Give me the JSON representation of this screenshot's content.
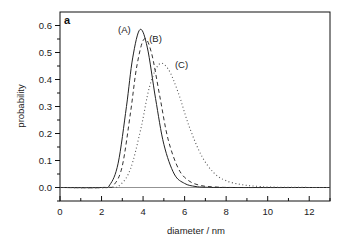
{
  "chart_data": {
    "type": "line",
    "title": "",
    "panel_label": "a",
    "xlabel": "diameter / nm",
    "ylabel": "probability",
    "xlim": [
      0,
      13
    ],
    "ylim": [
      -0.05,
      0.65
    ],
    "x_ticks": [
      0,
      2,
      4,
      6,
      8,
      10,
      12
    ],
    "x_tick_labels": [
      "0",
      "2",
      "4",
      "6",
      "8",
      "10",
      "12"
    ],
    "x_minor_ticks": [
      1,
      3,
      5,
      7,
      9,
      11,
      13
    ],
    "y_ticks": [
      0.0,
      0.1,
      0.2,
      0.3,
      0.4,
      0.5,
      0.6
    ],
    "y_tick_labels": [
      "0.0",
      "0.1",
      "0.2",
      "0.3",
      "0.4",
      "0.5",
      "0.6"
    ],
    "y_minor_ticks": [
      -0.05,
      0.05,
      0.15,
      0.25,
      0.35,
      0.45,
      0.55
    ],
    "grid": false,
    "legend": "inline labels near peaks",
    "series": [
      {
        "name": "(A)",
        "style": "solid",
        "peak_x": 3.85,
        "peak_y": 0.585,
        "x": [
          0,
          2.0,
          2.4,
          2.8,
          3.2,
          3.5,
          3.85,
          4.2,
          4.6,
          5.0,
          5.5,
          6.0,
          6.5,
          7.0,
          8.0,
          13.0
        ],
        "y": [
          0,
          0.0,
          0.01,
          0.09,
          0.3,
          0.48,
          0.585,
          0.52,
          0.33,
          0.16,
          0.05,
          0.015,
          0.004,
          0.001,
          0,
          0
        ]
      },
      {
        "name": "(B)",
        "style": "dashed",
        "peak_x": 4.05,
        "peak_y": 0.55,
        "x": [
          0,
          2.2,
          2.6,
          3.0,
          3.4,
          3.7,
          4.05,
          4.4,
          4.8,
          5.2,
          5.7,
          6.2,
          6.8,
          7.5,
          8.5,
          13.0
        ],
        "y": [
          0,
          0.0,
          0.01,
          0.08,
          0.28,
          0.45,
          0.55,
          0.5,
          0.34,
          0.18,
          0.07,
          0.025,
          0.007,
          0.002,
          0,
          0
        ]
      },
      {
        "name": "(C)",
        "style": "dotted",
        "peak_x": 4.75,
        "peak_y": 0.455,
        "x": [
          0,
          2.4,
          2.9,
          3.4,
          3.9,
          4.3,
          4.75,
          5.2,
          5.7,
          6.2,
          6.8,
          7.4,
          8.0,
          8.8,
          9.6,
          10.5,
          13.0
        ],
        "y": [
          0,
          0.0,
          0.01,
          0.07,
          0.22,
          0.37,
          0.455,
          0.44,
          0.35,
          0.23,
          0.12,
          0.055,
          0.025,
          0.01,
          0.004,
          0.001,
          0
        ]
      }
    ],
    "annotations": [
      {
        "text": "(A)",
        "x": 3.1,
        "y": 0.585
      },
      {
        "text": "(B)",
        "x": 4.6,
        "y": 0.55
      },
      {
        "text": "(C)",
        "x": 5.85,
        "y": 0.455
      }
    ]
  }
}
